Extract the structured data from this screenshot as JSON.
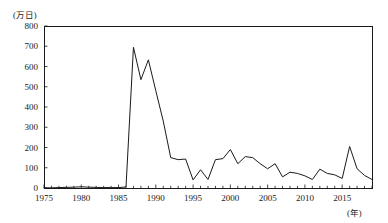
{
  "chart_data": {
    "type": "line",
    "title": "",
    "xlabel": "(年)",
    "ylabel": "(万日)",
    "xlim": [
      1975,
      2019
    ],
    "ylim": [
      0,
      800
    ],
    "ytick_labels": [
      "800",
      "700",
      "600",
      "500",
      "400",
      "300",
      "200",
      "100",
      "0"
    ],
    "ytick_values": [
      800,
      700,
      600,
      500,
      400,
      300,
      200,
      100,
      0
    ],
    "xtick_labels": [
      "1975",
      "1980",
      "1985",
      "1990",
      "1995",
      "2000",
      "2005",
      "2010",
      "2015"
    ],
    "xtick_values": [
      1975,
      1980,
      1985,
      1990,
      1995,
      2000,
      2005,
      2010,
      2015
    ],
    "grid": false,
    "legend": "none",
    "line_color": "#1a1a1a",
    "axis_color": "#1a1a1a",
    "x": [
      1975,
      1976,
      1977,
      1978,
      1979,
      1980,
      1981,
      1982,
      1983,
      1984,
      1985,
      1986,
      1987,
      1988,
      1989,
      1990,
      1991,
      1992,
      1993,
      1994,
      1995,
      1996,
      1997,
      1998,
      1999,
      2000,
      2001,
      2002,
      2003,
      2004,
      2005,
      2006,
      2007,
      2008,
      2009,
      2010,
      2011,
      2012,
      2013,
      2014,
      2015,
      2016,
      2017,
      2018,
      2019
    ],
    "values": [
      1,
      1,
      2,
      3,
      4,
      6,
      4,
      3,
      2,
      2,
      2,
      5,
      695,
      535,
      633,
      480,
      330,
      150,
      140,
      143,
      40,
      90,
      42,
      140,
      145,
      190,
      120,
      155,
      150,
      120,
      95,
      120,
      55,
      78,
      72,
      60,
      42,
      93,
      72,
      65,
      47,
      205,
      95,
      62,
      42
    ],
    "series": [
      {
        "name": "労働損失日数",
        "values": [
          1,
          1,
          2,
          3,
          4,
          6,
          4,
          3,
          2,
          2,
          2,
          5,
          695,
          535,
          633,
          480,
          330,
          150,
          140,
          143,
          40,
          90,
          42,
          140,
          145,
          190,
          120,
          155,
          150,
          120,
          95,
          120,
          55,
          78,
          72,
          60,
          42,
          93,
          72,
          65,
          47,
          205,
          95,
          62,
          42
        ]
      }
    ],
    "annotations": []
  },
  "axes": {
    "y_unit_label": "(万日)",
    "x_unit_label": "(年)"
  }
}
